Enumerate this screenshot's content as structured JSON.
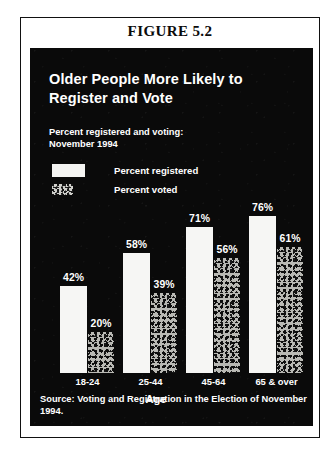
{
  "figure": {
    "number_label": "FIGURE 5.2"
  },
  "chart_data": {
    "type": "bar",
    "title": "Older People More Likely to Register and Vote",
    "subtitle": "Percent registered and voting:\nNovember 1994",
    "xlabel": "Age",
    "ylabel": "",
    "ylim": [
      0,
      80
    ],
    "grid": false,
    "legend_position": "top-left",
    "categories": [
      "18-24",
      "25-44",
      "45-64",
      "65 & over"
    ],
    "series": [
      {
        "name": "Percent registered",
        "swatch": "solid-white",
        "values": [
          42,
          58,
          71,
          76
        ],
        "labels": [
          "42%",
          "58%",
          "71%",
          "76%"
        ]
      },
      {
        "name": "Percent voted",
        "swatch": "stippled",
        "values": [
          20,
          39,
          56,
          61
        ],
        "labels": [
          "20%",
          "39%",
          "56%",
          "61%"
        ]
      }
    ],
    "source": "Source: Voting and Registration in the Election of November 1994."
  },
  "colors": {
    "panel_background": "#0a0a0a",
    "page_background": "#ffffff",
    "bar_registered": "#f6f6f4",
    "bar_voted": "#b9b9b4",
    "text_on_panel": "#ffffff",
    "frame_border": "#111111"
  }
}
